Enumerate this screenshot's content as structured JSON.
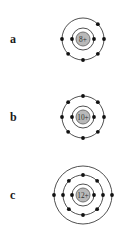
{
  "figure": {
    "background_color": "#ffffff",
    "shell_color": "#3c3c3c",
    "electron_color": "#111111",
    "nucleus_fill": "#b9b9b9",
    "nucleus_stroke": "#6a6a6a",
    "nucleus_text_color": "#303030"
  },
  "atoms": [
    {
      "label": "a",
      "nucleus_charge": "8+",
      "shell_count": 2,
      "electrons_per_shell": [
        2,
        6
      ],
      "shell_radii": [
        11,
        21
      ],
      "nucleus_radius": 7,
      "electron_radius": 1.9,
      "shells": [
        {
          "index": 0,
          "radius": 11,
          "angles": [
            180,
            0
          ]
        },
        {
          "index": 1,
          "radius": 21,
          "angles": [
            180,
            0,
            315,
            225,
            270,
            45
          ]
        }
      ]
    },
    {
      "label": "b",
      "nucleus_charge": "10+",
      "shell_count": 2,
      "electrons_per_shell": [
        2,
        8
      ],
      "shell_radii": [
        11,
        21
      ],
      "nucleus_radius": 7,
      "electron_radius": 1.9,
      "shells": [
        {
          "index": 0,
          "radius": 11,
          "angles": [
            180,
            0
          ]
        },
        {
          "index": 1,
          "radius": 21,
          "angles": [
            180,
            0,
            90,
            270,
            45,
            135,
            225,
            315
          ]
        }
      ]
    },
    {
      "label": "c",
      "nucleus_charge": "12+",
      "shell_count": 3,
      "electrons_per_shell": [
        2,
        8,
        2
      ],
      "shell_radii": [
        11,
        20,
        29
      ],
      "nucleus_radius": 7,
      "electron_radius": 1.9,
      "shells": [
        {
          "index": 0,
          "radius": 11,
          "angles": [
            180,
            0
          ]
        },
        {
          "index": 1,
          "radius": 20,
          "angles": [
            180,
            0,
            90,
            270,
            45,
            135,
            225,
            315
          ]
        },
        {
          "index": 2,
          "radius": 29,
          "angles": [
            180,
            0
          ]
        }
      ]
    }
  ]
}
